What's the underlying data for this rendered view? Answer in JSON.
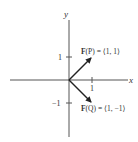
{
  "axes": {
    "x_label": "x",
    "y_label": "y",
    "x_tick": "1",
    "y_tick_pos": "1",
    "y_tick_neg": "−1"
  },
  "vectors": [
    {
      "label_bold": "F",
      "label_rest": "(P) = ⟨1, 1⟩",
      "dx": 1,
      "dy": 1
    },
    {
      "label_bold": "F",
      "label_rest": "(Q) = ⟨1, −1⟩",
      "dx": 1,
      "dy": -1
    }
  ],
  "colors": {
    "axis": "#555555",
    "vector": "#222222",
    "text": "#333333"
  }
}
